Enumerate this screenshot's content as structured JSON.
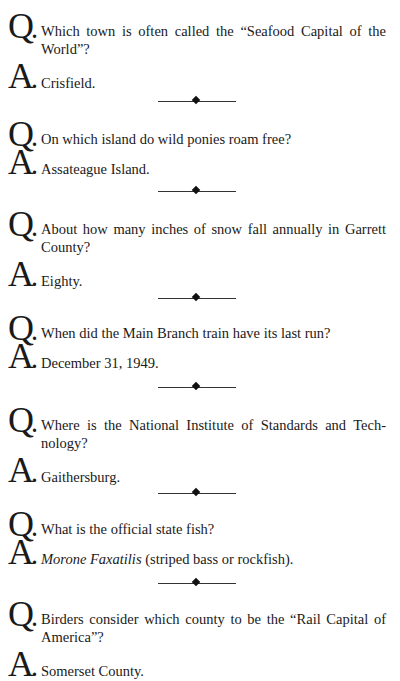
{
  "labels": {
    "question": "Q",
    "answer": "A",
    "dot": "."
  },
  "qa": [
    {
      "question": "Which town is often called the “Seafood Capital of the World”?",
      "answer": "Crisfield."
    },
    {
      "question": "On which island do wild ponies roam free?",
      "answer": "Assateague Island."
    },
    {
      "question": "About how many inches of snow fall annually in Garrett County?",
      "answer": "Eighty."
    },
    {
      "question": "When did the Main Branch train have its last run?",
      "answer": "December 31, 1949."
    },
    {
      "question": "Where is the National Institute of Standards and Tech-nology?",
      "answer": "Gaithersburg."
    },
    {
      "question": "What is the official state fish?",
      "answer_italic": "Morone Faxatilis",
      "answer": " (striped bass or rockfish)."
    },
    {
      "question": "Birders consider which county to be the “Rail Capital of America”?",
      "answer": "Somerset County."
    }
  ]
}
